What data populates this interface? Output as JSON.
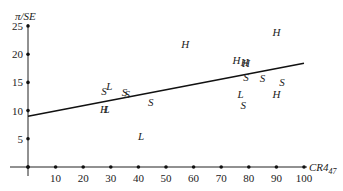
{
  "chart_data": {
    "type": "scatter",
    "title": "",
    "xlabel": "CR4_47",
    "xlabel_main": "CR4",
    "xlabel_sub": "47",
    "ylabel": "π/SE",
    "xlim": [
      0,
      100
    ],
    "ylim": [
      0,
      25
    ],
    "x_ticks": [
      0,
      10,
      20,
      30,
      40,
      50,
      60,
      70,
      80,
      90,
      100
    ],
    "x_tick_labels": [
      "10",
      "20",
      "30",
      "40",
      "50",
      "60",
      "70",
      "80",
      "90",
      "100"
    ],
    "y_ticks": [
      0,
      5,
      10,
      15,
      20,
      25
    ],
    "y_tick_labels": [
      "5",
      "10",
      "15",
      "20",
      "25"
    ],
    "grid": false,
    "legend": "none (points are labelled by category marker letters H, L, S)",
    "marker_categories": [
      "H",
      "L",
      "S"
    ],
    "points": [
      {
        "label": "S",
        "x": 27.5,
        "y": 13.5
      },
      {
        "label": "L",
        "x": 29.5,
        "y": 14.3
      },
      {
        "label": "H",
        "x": 27.5,
        "y": 10.2
      },
      {
        "label": "L",
        "x": 28.5,
        "y": 10.2
      },
      {
        "label": "S",
        "x": 35,
        "y": 13.3
      },
      {
        "label": "S",
        "x": 36,
        "y": 12.9
      },
      {
        "label": "S",
        "x": 44.5,
        "y": 11.5
      },
      {
        "label": "L",
        "x": 41,
        "y": 5.5
      },
      {
        "label": "H",
        "x": 57,
        "y": 21.8
      },
      {
        "label": "H",
        "x": 75.5,
        "y": 18.9
      },
      {
        "label": "H",
        "x": 78.5,
        "y": 18.7
      },
      {
        "label": "H",
        "x": 79,
        "y": 18.5
      },
      {
        "label": "S",
        "x": 79,
        "y": 16.0
      },
      {
        "label": "S",
        "x": 85,
        "y": 15.8
      },
      {
        "label": "S",
        "x": 92,
        "y": 15.0
      },
      {
        "label": "H",
        "x": 90,
        "y": 13.0
      },
      {
        "label": "H",
        "x": 90,
        "y": 24.0
      },
      {
        "label": "L",
        "x": 77,
        "y": 13.0
      },
      {
        "label": "S",
        "x": 78,
        "y": 11.0
      }
    ],
    "fit_line": {
      "type": "linear regression",
      "x": [
        0,
        100
      ],
      "y": [
        9.0,
        18.4
      ]
    }
  }
}
